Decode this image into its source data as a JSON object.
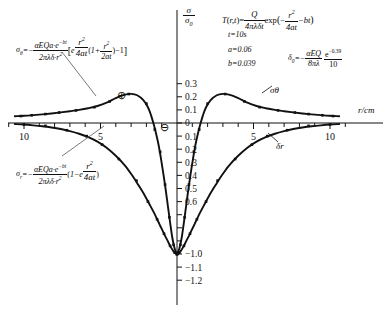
{
  "chart_data": {
    "type": "line",
    "title": "",
    "xlabel": "r/cm",
    "ylabel": "σ/σ₀",
    "xlim": [
      -11.2,
      11.2
    ],
    "ylim": [
      -1.25,
      0.36
    ],
    "grid": false,
    "legend_position": "inline-curve-labels",
    "xticks_major": [
      -10,
      -5,
      0,
      5,
      10
    ],
    "xtick_labels": [
      "10",
      "5",
      "0",
      "5",
      "10"
    ],
    "xtick_minor_step": 1,
    "yticks": [
      0.3,
      0.2,
      0.1,
      0,
      -0.1,
      -0.2,
      -0.3,
      -0.4,
      -0.5,
      -0.6,
      -0.7,
      -0.8,
      -0.9,
      -1.0,
      -1.1,
      -1.2
    ],
    "ytick_labels": [
      "0.3",
      "0.2",
      "0.1",
      "0",
      "0.1",
      "0.2",
      "0.3",
      "0.4",
      "0.5",
      "0.6",
      "",
      "",
      "",
      "1.0",
      "1.1",
      "1.2"
    ],
    "ytick_minus_prefix_from": -1.0,
    "series": [
      {
        "name": "σθ",
        "label": "σθ",
        "points_x": [
          -10.6,
          -10.0,
          -9.4,
          -8.8,
          -8.2,
          -7.6,
          -7.0,
          -6.4,
          -5.8,
          -5.2,
          -4.6,
          -4.0,
          -3.4,
          -3.0,
          -2.6,
          -2.2,
          -1.9,
          -1.7,
          -1.5,
          -1.35,
          -1.2,
          -1.05,
          -0.9,
          -0.75,
          -0.6,
          -0.45,
          -0.3,
          -0.15,
          0
        ],
        "points_y": [
          0.052,
          0.055,
          0.06,
          0.066,
          0.073,
          0.081,
          0.09,
          0.1,
          0.113,
          0.13,
          0.155,
          0.19,
          0.216,
          0.222,
          0.212,
          0.175,
          0.12,
          0.06,
          -0.02,
          -0.09,
          -0.17,
          -0.27,
          -0.38,
          -0.5,
          -0.63,
          -0.76,
          -0.88,
          -0.96,
          -1.0
        ],
        "markers_x": [
          -10.2,
          -9.5,
          -8.6,
          -7.7,
          -6.6,
          -5.4,
          -4.4,
          -3.15,
          -2.0,
          -1.45,
          -1.1,
          -0.78,
          -0.5,
          -0.22,
          0
        ],
        "markers_y": [
          0.053,
          0.059,
          0.068,
          0.08,
          0.096,
          0.121,
          0.165,
          0.221,
          0.148,
          -0.05,
          -0.22,
          -0.47,
          -0.72,
          -0.93,
          -1.0
        ]
      },
      {
        "name": "σr",
        "label": "δr",
        "points_x": [
          -10.6,
          -10.0,
          -9.4,
          -8.8,
          -8.2,
          -7.6,
          -7.0,
          -6.4,
          -5.8,
          -5.2,
          -4.6,
          -4.0,
          -3.4,
          -2.9,
          -2.5,
          -2.1,
          -1.8,
          -1.55,
          -1.35,
          -1.15,
          -0.95,
          -0.78,
          -0.6,
          -0.42,
          -0.25,
          -0.12,
          0
        ],
        "points_y": [
          -0.008,
          -0.012,
          -0.018,
          -0.025,
          -0.034,
          -0.046,
          -0.062,
          -0.082,
          -0.108,
          -0.142,
          -0.188,
          -0.25,
          -0.325,
          -0.405,
          -0.478,
          -0.555,
          -0.62,
          -0.675,
          -0.722,
          -0.772,
          -0.82,
          -0.862,
          -0.902,
          -0.944,
          -0.976,
          -0.993,
          -1.0
        ],
        "markers_x": [
          -10.0,
          -8.6,
          -7.2,
          -5.9,
          -4.9,
          -3.8,
          -2.65,
          -1.9,
          -1.3,
          -0.85,
          -0.45,
          -0.15,
          0
        ],
        "markers_y": [
          -0.012,
          -0.022,
          -0.055,
          -0.1,
          -0.165,
          -0.275,
          -0.44,
          -0.6,
          -0.735,
          -0.845,
          -0.938,
          -0.99,
          -1.0
        ]
      }
    ],
    "annotations": [
      {
        "name": "plus-region-marker",
        "symbol": "⊕",
        "x": -3.6,
        "y": 0.135
      },
      {
        "name": "minus-region-marker",
        "symbol": "⊖",
        "x": -0.62,
        "y": -0.115
      }
    ]
  },
  "axes": {
    "y_axis_title_num": "σ",
    "y_axis_title_den": "σ",
    "y_axis_title_den_sub": "0",
    "x_axis_title": "r/cm"
  },
  "formula_theta": {
    "lhs_sym": "σ",
    "lhs_sub": "θ",
    "eq": "=−",
    "num": "αEQa·e",
    "num_sup": "−bt",
    "den": "2πλδ·r",
    "den_sup": "2",
    "bracket_open": "[",
    "e_base": "e",
    "e_sup_num": "r",
    "e_sup_num_sup": "2",
    "e_sup_den": "4at",
    "paren_open": "(",
    "one_plus": "1+",
    "inner_num": "r",
    "inner_num_sup": "2",
    "inner_den": "2at",
    "paren_close": ")",
    "minus_one": "−1",
    "bracket_close": "]"
  },
  "formula_r": {
    "lhs_sym": "σ",
    "lhs_sub": "r",
    "eq": "=−",
    "num": "αEQa·e",
    "num_sup": "−bt",
    "den": "2πλδ·r",
    "den_sup": "2",
    "paren_open": "(",
    "one_minus": "1−e",
    "e_sup_num": "r",
    "e_sup_num_sup": "2",
    "e_sup_den": "4at",
    "paren_close": ")"
  },
  "formula_T": {
    "lhs": "T",
    "paren_open": "(",
    "args": "r,t",
    "paren_close": ")",
    "eq": "=",
    "num": "Q",
    "den": "4πλδt",
    "exp": "exp",
    "exp_paren_open": "(",
    "minus": "−",
    "e_num": "r",
    "e_num_sup": "2",
    "e_den": "4at",
    "minus_bt": "−bt",
    "exp_paren_close": ")"
  },
  "params": {
    "t": "t=10s",
    "a": "a=0.06",
    "b": "b=0.039"
  },
  "formula_delta0": {
    "lhs_sym": "δ",
    "lhs_sub": "0",
    "eq": "=−",
    "num": "αEQ",
    "den": "8πλ",
    "frac2_num": "e",
    "frac2_num_sup": "−0.39",
    "frac2_den": "10"
  },
  "caption": {
    "text": ""
  }
}
